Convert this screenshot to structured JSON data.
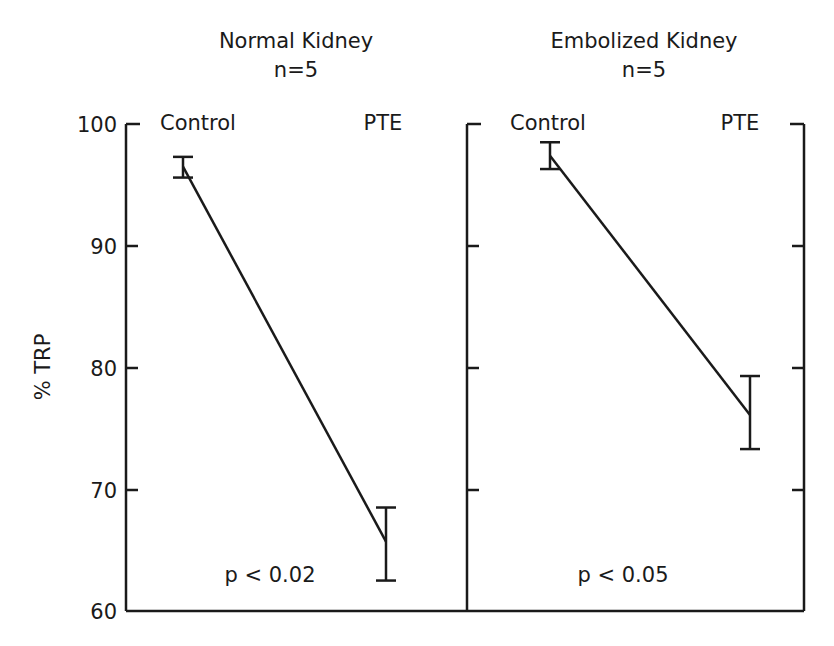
{
  "chart_data": [
    {
      "type": "line",
      "title": "Normal Kidney",
      "subtitle": "n=5",
      "xlabel": "",
      "ylabel": "% TRP",
      "categories": [
        "Control",
        "PTE"
      ],
      "series": [
        {
          "name": "Normal Kidney",
          "values": [
            96.5,
            65.7
          ],
          "error_low": [
            95.6,
            62.5
          ],
          "error_high": [
            97.3,
            68.5
          ]
        }
      ],
      "annotation": "p < 0.02",
      "ylim": [
        60,
        100
      ],
      "yticks": [
        60,
        70,
        80,
        90,
        100
      ],
      "grid": false,
      "legend": "none"
    },
    {
      "type": "line",
      "title": "Embolized Kidney",
      "subtitle": "n=5",
      "xlabel": "",
      "ylabel": "% TRP",
      "categories": [
        "Control",
        "PTE"
      ],
      "series": [
        {
          "name": "Embolized Kidney",
          "values": [
            97.4,
            76.1
          ],
          "error_low": [
            96.3,
            73.3
          ],
          "error_high": [
            98.5,
            79.3
          ]
        }
      ],
      "annotation": "p < 0.05",
      "ylim": [
        60,
        100
      ],
      "yticks": [
        60,
        70,
        80,
        90,
        100
      ],
      "grid": false,
      "legend": "none"
    }
  ],
  "figure": {
    "ylabel": "% TRP",
    "ytick_labels": [
      "100",
      "90",
      "80",
      "70",
      "60"
    ],
    "left_panel": {
      "title": "Normal Kidney",
      "n_label": "n=5",
      "control_label": "Control",
      "pte_label": "PTE",
      "p_value": "p < 0.02"
    },
    "right_panel": {
      "title": "Embolized Kidney",
      "n_label": "n=5",
      "control_label": "Control",
      "pte_label": "PTE",
      "p_value": "p < 0.05"
    },
    "line_color": "#1a1a1a"
  }
}
